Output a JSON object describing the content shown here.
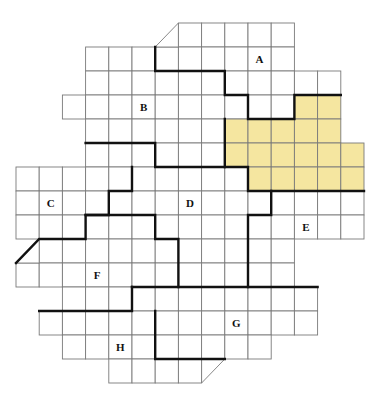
{
  "diagram": {
    "grid": {
      "origin_x": 16,
      "origin_y": 23,
      "cell_w": 23.2,
      "cell_h": 24,
      "rows": [
        {
          "row": 0,
          "from": 7,
          "to": 11
        },
        {
          "row": 1,
          "from": 3,
          "to": 11
        },
        {
          "row": 2,
          "from": 3,
          "to": 13
        },
        {
          "row": 3,
          "from": 2,
          "to": 13
        },
        {
          "row": 4,
          "from": 3,
          "to": 13
        },
        {
          "row": 5,
          "from": 3,
          "to": 14
        },
        {
          "row": 6,
          "from": 0,
          "to": 14
        },
        {
          "row": 7,
          "from": 0,
          "to": 14
        },
        {
          "row": 8,
          "from": 0,
          "to": 14
        },
        {
          "row": 9,
          "from": 1,
          "to": 11
        },
        {
          "row": 10,
          "from": 0,
          "to": 11
        },
        {
          "row": 11,
          "from": 2,
          "to": 12
        },
        {
          "row": 12,
          "from": 1,
          "to": 12
        },
        {
          "row": 13,
          "from": 2,
          "to": 10
        },
        {
          "row": 14,
          "from": 4,
          "to": 7
        }
      ],
      "triangles": [
        {
          "points": [
            [
              155.2,
              47
            ],
            [
              178.4,
              23
            ],
            [
              178.4,
              47
            ]
          ],
          "note": "top diagonal corner",
          "thick": false
        },
        {
          "points": [
            [
              16,
              263
            ],
            [
              39.2,
              239
            ],
            [
              39.2,
              263
            ]
          ],
          "note": "left diagonal corner",
          "thick": true
        },
        {
          "points": [
            [
              201.6,
              359
            ],
            [
              224.8,
              359
            ],
            [
              201.6,
              383
            ]
          ],
          "note": "bottom diagonal corner",
          "thick": false
        }
      ]
    },
    "highlight": {
      "color": "#f5e6a0",
      "cells": [
        {
          "row": 3,
          "from": 12,
          "to": 13
        },
        {
          "row": 4,
          "from": 9,
          "to": 13
        },
        {
          "row": 5,
          "from": 9,
          "to": 14
        },
        {
          "row": 6,
          "from": 10,
          "to": 14
        }
      ]
    },
    "boundaries": [
      "M155.2,47 L155.2,71 L224.8,71 L224.8,95 L248,95 L248,119 L294.4,119 L294.4,95 L340.8,95",
      "M224.8,119 L224.8,167 L248,167 L248,191 L364,191",
      "M85.6,143 L155.2,143 L155.2,167 L224.8,167",
      "M132,167 L132,191 L108.8,191 L108.8,215 L85.6,215 L85.6,239 L39.2,239 L16,263",
      "M85.6,215 L155.2,215 L155.2,239 L178.4,239 L178.4,287",
      "M271.2,191 L271.2,215 L248,215 L248,287",
      "M132,287 L317.6,287",
      "M132,287 L132,311 L39.2,311",
      "M155.2,311 L155.2,359 L224.8,359"
    ],
    "labels": [
      {
        "text": "A",
        "x": 259.6,
        "y": 59
      },
      {
        "text": "B",
        "x": 143.6,
        "y": 107
      },
      {
        "text": "C",
        "x": 50.8,
        "y": 203
      },
      {
        "text": "D",
        "x": 190,
        "y": 203
      },
      {
        "text": "E",
        "x": 306,
        "y": 227
      },
      {
        "text": "F",
        "x": 97.2,
        "y": 275
      },
      {
        "text": "G",
        "x": 236.4,
        "y": 323
      },
      {
        "text": "H",
        "x": 120.4,
        "y": 347
      }
    ]
  }
}
